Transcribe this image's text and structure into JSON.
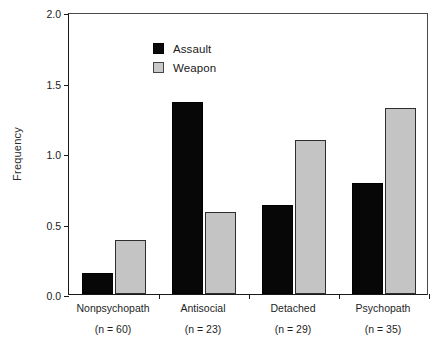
{
  "chart_data": {
    "type": "bar",
    "title": "",
    "xlabel": "",
    "ylabel": "Frequency",
    "ylim": [
      0.0,
      2.0
    ],
    "yticks": [
      "0.0",
      "0.5",
      "1.0",
      "1.5",
      "2.0"
    ],
    "ytick_values": [
      0.0,
      0.5,
      1.0,
      1.5,
      2.0
    ],
    "grid": false,
    "legend_position": "upper left",
    "categories": [
      "Nonpsychopath",
      "Antisocial",
      "Detached",
      "Psychopath"
    ],
    "category_notes": [
      "(n = 60)",
      "(n = 23)",
      "(n = 29)",
      "(n = 35)"
    ],
    "series": [
      {
        "name": "Assault",
        "color": "#0a0a0a",
        "values": [
          0.15,
          1.36,
          0.63,
          0.79
        ]
      },
      {
        "name": "Weapon",
        "color": "#c9c9c9",
        "values": [
          0.38,
          0.58,
          1.09,
          1.32
        ]
      }
    ]
  },
  "legend": {
    "items": [
      {
        "label": "Assault",
        "swatch": "assault"
      },
      {
        "label": "Weapon",
        "swatch": "weapon"
      }
    ]
  }
}
